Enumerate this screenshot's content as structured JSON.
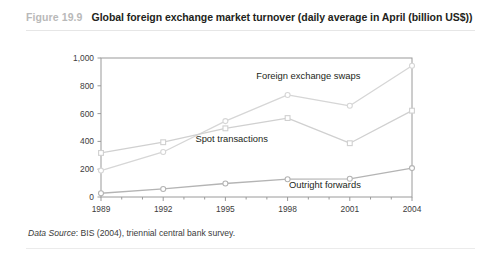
{
  "figure": {
    "number": "Figure 19.9",
    "title": "Global foreign exchange market turnover (daily average in April (billion US$))",
    "source_label": "Data Source",
    "source_text": ": BIS (2004), triennial central bank survey."
  },
  "chart_data": {
    "type": "line",
    "title": "Global foreign exchange market turnover (daily average in April (billion US$))",
    "xlabel": "",
    "ylabel": "",
    "x": [
      1989,
      1992,
      1995,
      1998,
      2001,
      2004
    ],
    "categories": [
      "1989",
      "1992",
      "1995",
      "1998",
      "2001",
      "2004"
    ],
    "xlim": [
      1989,
      2004
    ],
    "ylim": [
      0,
      1000
    ],
    "yticks": [
      0,
      200,
      400,
      600,
      800,
      1000
    ],
    "ytick_labels": [
      "0",
      "200",
      "400",
      "600",
      "800",
      "1,000"
    ],
    "xticks": [
      1989,
      1992,
      1995,
      1998,
      2001,
      2004
    ],
    "xtick_labels": [
      "1989",
      "1992",
      "1995",
      "1998",
      "2001",
      "2004"
    ],
    "grid": false,
    "legend": "inline-annotations",
    "series": [
      {
        "name": "Foreign exchange swaps",
        "marker": "circle",
        "color": "#d6d6d6",
        "label_x": 1999.0,
        "label_y": 870,
        "values": [
          190,
          324,
          546,
          734,
          656,
          944
        ]
      },
      {
        "name": "Spot transactions",
        "marker": "square",
        "color": "#d0d0d0",
        "label_x": 1995.3,
        "label_y": 418,
        "values": [
          317,
          394,
          494,
          568,
          387,
          621
        ]
      },
      {
        "name": "Outright forwards",
        "marker": "circle",
        "color": "#b4b4b4",
        "label_x": 1999.8,
        "label_y": 88,
        "values": [
          27,
          58,
          97,
          128,
          131,
          208
        ]
      }
    ]
  },
  "colors": {
    "axis": "#9a9a9a",
    "text": "#231f20",
    "fig_number": "#b9b9b9",
    "rule": "#e6e6e6",
    "background": "#ffffff"
  }
}
